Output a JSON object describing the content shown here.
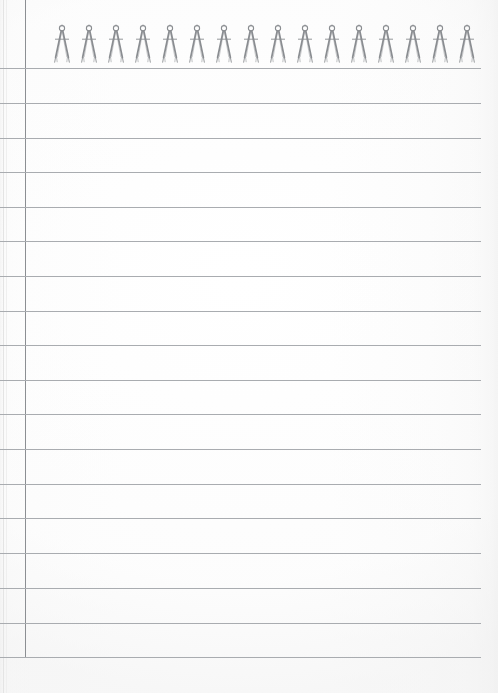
{
  "document": {
    "type": "notepad-page",
    "title": "Lined notepad page with spiral compass binding",
    "orientation": "portrait",
    "width_px": 498,
    "height_px": 693
  },
  "paper": {
    "background_color": "#ffffff",
    "tint_color": "#fdfdfd",
    "edge_color": "#e4e4e4"
  },
  "binding": {
    "icon_name": "drafting-compass-icon",
    "count": 16,
    "first_x": 62,
    "spacing_px": 27,
    "top_px": 24,
    "color": "#8a8d91"
  },
  "margin_rule": {
    "x": 25,
    "top": 0,
    "bottom": 657,
    "color": "#8c8f93"
  },
  "ruled_lines": {
    "color": "#a9acb0",
    "left_x": 0,
    "right_x": 481,
    "count": 18,
    "first_y": 68,
    "spacing_px": 34.6,
    "y_positions": [
      68,
      103,
      138,
      172,
      207,
      241,
      276,
      311,
      345,
      380,
      414,
      449,
      484,
      518,
      553,
      588,
      623,
      657
    ]
  },
  "content": {
    "body_text": "",
    "note": "blank ruled page — no written content"
  }
}
